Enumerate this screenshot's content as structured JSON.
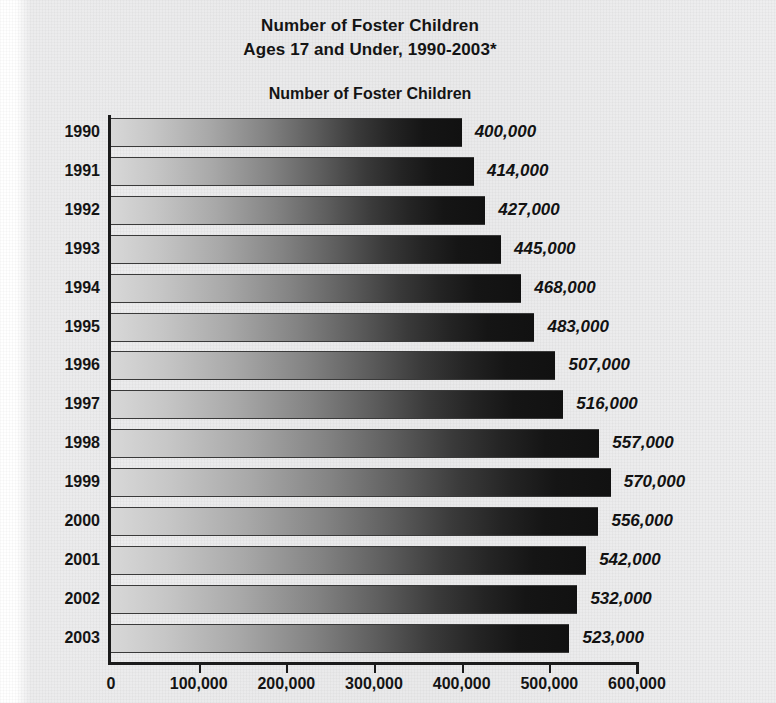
{
  "chart_data": {
    "type": "bar",
    "orientation": "horizontal",
    "title": "Number of Foster Children",
    "title_line2": "Ages 17 and Under, 1990-2003*",
    "subtitle": "Number of Foster Children",
    "xlabel": "",
    "ylabel": "",
    "xlim": [
      0,
      600000
    ],
    "grid": false,
    "legend": null,
    "categories": [
      "1990",
      "1991",
      "1992",
      "1993",
      "1994",
      "1995",
      "1996",
      "1997",
      "1998",
      "1999",
      "2000",
      "2001",
      "2002",
      "2003"
    ],
    "values": [
      400000,
      414000,
      427000,
      445000,
      468000,
      483000,
      507000,
      516000,
      557000,
      570000,
      556000,
      542000,
      532000,
      523000
    ],
    "value_labels": [
      "400,000",
      "414,000",
      "427,000",
      "445,000",
      "468,000",
      "483,000",
      "507,000",
      "516,000",
      "557,000",
      "570,000",
      "556,000",
      "542,000",
      "532,000",
      "523,000"
    ],
    "xticks": [
      0,
      100000,
      200000,
      300000,
      400000,
      500000,
      600000
    ],
    "xtick_labels": [
      "0",
      "100,000",
      "200,000",
      "300,000",
      "400,000",
      "500,000",
      "600,000"
    ],
    "colors": {
      "bar_gradient_start": "#d8d8d8",
      "bar_gradient_end": "#111111",
      "axis": "#1b1b1b",
      "text": "#141414",
      "background": "#e9e9ea"
    }
  }
}
